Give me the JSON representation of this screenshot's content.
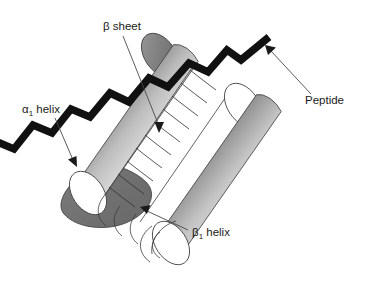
{
  "figure": {
    "background_color": "#ffffff"
  },
  "labels": {
    "beta_sheet": {
      "text": "β sheet",
      "x": 103,
      "y": 30
    },
    "alpha1_helix": {
      "base": "α",
      "subscript": "1",
      "suffix": " helix",
      "x": 22,
      "y": 113
    },
    "beta1_helix": {
      "base": "β",
      "subscript": "1",
      "suffix": " helix",
      "x": 192,
      "y": 236
    },
    "peptide": {
      "text": "Peptide",
      "x": 305,
      "y": 104
    }
  },
  "colors": {
    "ink": "#1a1a1a",
    "leader": "#4a4a4a",
    "outline": "#3b3b3b",
    "chain": "#111111",
    "cylinder_dark": "#3a3a3a",
    "cylinder_light": "#fdfdfd",
    "cap_shadow": "#8e8e8e",
    "sheet_shadow": "#6f6f6f"
  },
  "elements": {
    "alpha1_cylinder": "upper-left shaded cylinder representing the alpha-1 helix",
    "beta1_cylinder": "lower-right shaded cylinder representing the beta-1 helix",
    "beta_sheet_ladder": "ladder of rungs between the two helices forming the beta sheet",
    "peptide_chain": "thick black zigzag chain running diagonally across the structure"
  }
}
